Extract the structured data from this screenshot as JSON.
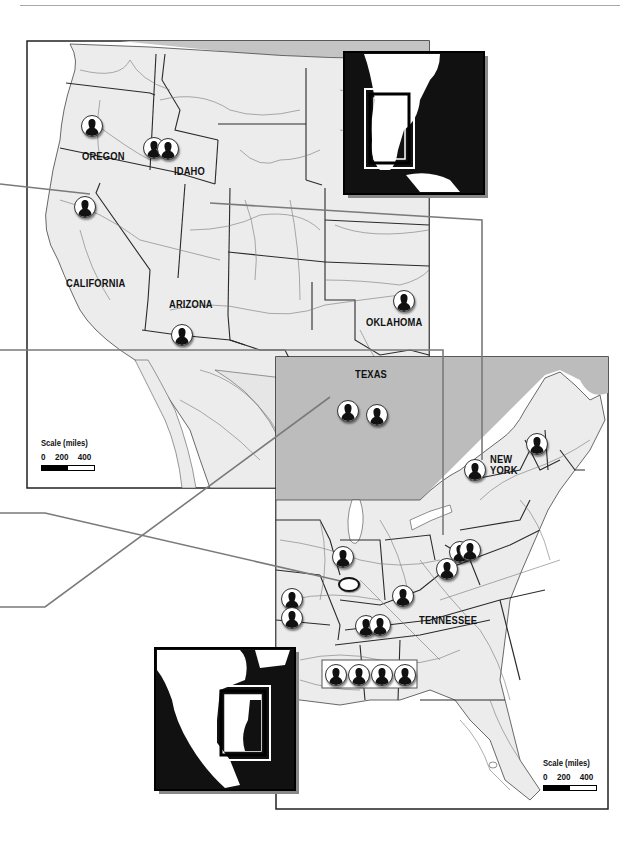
{
  "map": {
    "colors": {
      "land": "#ececec",
      "water": "#ffffff",
      "lake": "#b5b5b5",
      "border": "#2a2a2a",
      "road": "#6a6a6a",
      "connector": "#7a7a7a",
      "inset_dark": "#111111"
    },
    "west_panel": {
      "state_labels": [
        {
          "name": "OREGON"
        },
        {
          "name": "IDAHO"
        },
        {
          "name": "CALIFORNIA"
        },
        {
          "name": "ARIZONA"
        },
        {
          "name": "OKLAHOMA"
        },
        {
          "name": "TEXAS"
        }
      ],
      "scale": {
        "title": "Scale (miles)",
        "ticks": [
          "0",
          "200",
          "400"
        ]
      },
      "markers": [
        {
          "state": "Oregon",
          "count": 1
        },
        {
          "state": "Idaho",
          "count": 2
        },
        {
          "state": "California",
          "count": 1
        },
        {
          "state": "Arizona",
          "count": 1
        },
        {
          "state": "Oklahoma",
          "count": 1
        },
        {
          "state": "Texas",
          "count": 2
        }
      ],
      "inset_icon": "locator-inset-west"
    },
    "east_panel": {
      "state_labels": [
        {
          "name": "NEW"
        },
        {
          "name": "YORK"
        },
        {
          "name": "TENNESSEE"
        }
      ],
      "scale": {
        "title": "Scale (miles)",
        "ticks": [
          "0",
          "200",
          "400"
        ]
      },
      "markers": [
        {
          "state": "New York",
          "count": 1
        },
        {
          "state": "Vermont",
          "count": 1
        },
        {
          "state": "Illinois",
          "count": 1
        },
        {
          "state": "Missouri",
          "count": 2
        },
        {
          "state": "Ohio/West Virginia",
          "count": 3
        },
        {
          "state": "Kentucky",
          "count": 1
        },
        {
          "state": "Tennessee",
          "count": 2
        },
        {
          "state": "Mississippi/Alabama",
          "count": 4
        }
      ],
      "highlight_marker": "white-oval-marker",
      "inset_icon": "locator-inset-east"
    }
  }
}
